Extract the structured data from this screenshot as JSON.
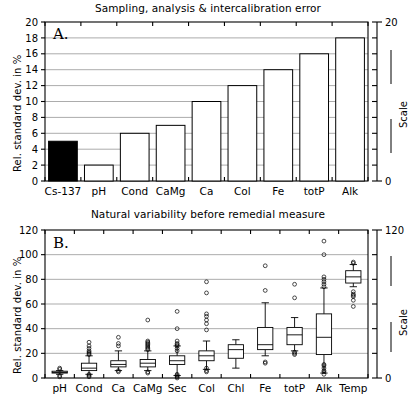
{
  "figure": {
    "ylabel": "Rel. standard dev. in %",
    "scale_label": "Scale"
  },
  "panel_a": {
    "letter": "A.",
    "title": "Sampling, analysis & intercalibration error",
    "right_axis_top": "20",
    "right_axis_bottom": "0"
  },
  "panel_b": {
    "letter": "B.",
    "title": "Natural variability before remedial measure",
    "right_axis_top": "120",
    "right_axis_bottom": "0"
  },
  "chart_data": [
    {
      "type": "bar",
      "title": "Sampling, analysis & intercalibration error",
      "panel": "A.",
      "xlabel": "",
      "ylabel": "Rel. standard dev. in %",
      "ylim": [
        0,
        20
      ],
      "yticks": [
        0,
        2,
        4,
        6,
        8,
        10,
        12,
        14,
        16,
        18,
        20
      ],
      "ytick_labels": [
        "0",
        "2",
        "4",
        "6",
        "8",
        "10",
        "12",
        "14",
        "16",
        "18",
        "20"
      ],
      "right_axis": {
        "label": "Scale",
        "ylim": [
          0,
          20
        ],
        "ticks": [
          0,
          20
        ],
        "tick_labels": [
          "0",
          "20"
        ]
      },
      "grid": true,
      "categories": [
        "Cs-137",
        "pH",
        "Cond",
        "CaMg",
        "Ca",
        "Col",
        "Fe",
        "totP",
        "Alk"
      ],
      "values": [
        5,
        2,
        6,
        7,
        10,
        12,
        14,
        16,
        18
      ],
      "highlight_index": 0,
      "highlight_color": "#000000",
      "bar_color": "#ffffff",
      "bar_edge_color": "#000000"
    },
    {
      "type": "boxplot",
      "title": "Natural variability before remedial measure",
      "panel": "B.",
      "xlabel": "",
      "ylabel": "Rel. standard dev. in %",
      "ylim": [
        0,
        120
      ],
      "yticks": [
        0,
        20,
        40,
        60,
        80,
        100,
        120
      ],
      "ytick_labels": [
        "0",
        "20",
        "40",
        "60",
        "80",
        "100",
        "120"
      ],
      "right_axis": {
        "label": "Scale",
        "ylim": [
          0,
          120
        ],
        "ticks": [
          0,
          120
        ],
        "tick_labels": [
          "0",
          "120"
        ]
      },
      "grid": true,
      "categories": [
        "pH",
        "Cond",
        "Ca",
        "CaMg",
        "Sec",
        "Col",
        "Chl",
        "Fe",
        "totP",
        "Alk",
        "Temp"
      ],
      "boxes": [
        {
          "name": "pH",
          "whisker_low": 3,
          "q1": 4,
          "median": 4.5,
          "q3": 5.5,
          "whisker_high": 6,
          "outliers": [
            1,
            2,
            7,
            8
          ]
        },
        {
          "name": "Cond",
          "whisker_low": 3,
          "q1": 6,
          "median": 8,
          "q3": 12,
          "whisker_high": 18,
          "outliers": [
            1,
            2,
            3,
            19,
            20,
            21,
            22,
            24,
            26,
            29
          ]
        },
        {
          "name": "Ca",
          "whisker_low": 6,
          "q1": 9,
          "median": 11,
          "q3": 14,
          "whisker_high": 22,
          "outliers": [
            5,
            6,
            26,
            28,
            33
          ]
        },
        {
          "name": "CaMg",
          "whisker_low": 6,
          "q1": 9,
          "median": 12,
          "q3": 15,
          "whisker_high": 22,
          "outliers": [
            4,
            5,
            23,
            24,
            25,
            26,
            27,
            28,
            29,
            30,
            47
          ]
        },
        {
          "name": "Sec",
          "whisker_low": 2,
          "q1": 11,
          "median": 14,
          "q3": 18,
          "whisker_high": 26,
          "outliers": [
            0,
            1,
            2,
            3,
            22,
            24,
            26,
            27,
            28,
            30,
            40,
            54
          ]
        },
        {
          "name": "Col",
          "whisker_low": 7,
          "q1": 14,
          "median": 18,
          "q3": 22,
          "whisker_high": 30,
          "outliers": [
            5,
            6,
            8,
            39,
            44,
            47,
            50,
            52,
            69,
            78
          ]
        },
        {
          "name": "Chl",
          "whisker_low": 8,
          "q1": 16,
          "median": 23,
          "q3": 27,
          "whisker_high": 31,
          "outliers": []
        },
        {
          "name": "Fe",
          "whisker_low": 18,
          "q1": 23,
          "median": 27,
          "q3": 41,
          "whisker_high": 61,
          "outliers": [
            12,
            13,
            71,
            91
          ]
        },
        {
          "name": "totP",
          "whisker_low": 22,
          "q1": 27,
          "median": 35,
          "q3": 41,
          "whisker_high": 49,
          "outliers": [
            19,
            20,
            21,
            65,
            76
          ]
        },
        {
          "name": "Alk",
          "whisker_low": 4,
          "q1": 19,
          "median": 33,
          "q3": 52,
          "whisker_high": 73,
          "outliers": [
            3,
            5,
            6,
            8,
            10,
            11,
            74,
            76,
            78,
            80,
            82,
            100,
            111
          ]
        },
        {
          "name": "Temp",
          "whisker_low": 74,
          "q1": 77,
          "median": 82,
          "q3": 87,
          "whisker_high": 92,
          "outliers": [
            58,
            63,
            66,
            67,
            68,
            70,
            93,
            94
          ]
        }
      ]
    }
  ]
}
